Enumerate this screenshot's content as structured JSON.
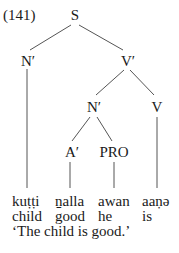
{
  "example_number": "(141)",
  "tree": {
    "root": "S",
    "nodes": {
      "subject_np": "N′",
      "vp": "V′",
      "pred_np": "N′",
      "verb": "V",
      "adj": "A′",
      "pro": "PRO"
    }
  },
  "words": [
    {
      "form": "kuṭṭi",
      "gloss": "child"
    },
    {
      "form": "ṉalla",
      "gloss": "good"
    },
    {
      "form": "awan",
      "gloss": "he"
    },
    {
      "form": "aaṇə",
      "gloss": "is"
    }
  ],
  "translation": "‘The child is good.’"
}
